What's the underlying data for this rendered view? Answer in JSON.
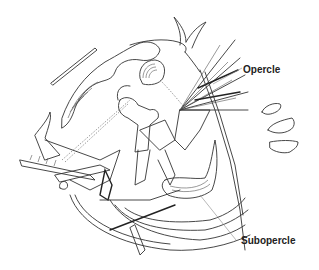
{
  "figure": {
    "background": "#ffffff",
    "line_color": "#333333"
  },
  "labels": {
    "opercle": "Opercle",
    "subopercle": "Subopercle"
  }
}
